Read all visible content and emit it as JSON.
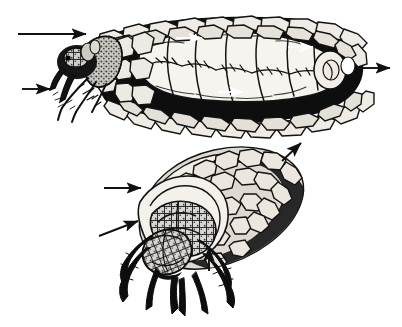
{
  "figure": {
    "title": "Caddisfly larva in portable stone case",
    "background_color": "#ffffff",
    "ink_color": "#111111",
    "width": 402,
    "height": 327,
    "caption": "",
    "panels": [
      {
        "id": "panel-top",
        "name": "lateral-cutaway-view",
        "description": "Lateral cutaway of a caddisfly larva inside its pebble case, anterior to the left, showing segmented abdomen with lateral gill tufts and the water current passing through the case",
        "orientation": "lateral",
        "bounds": {
          "x": 60,
          "y": 8,
          "width": 320,
          "height": 120
        }
      },
      {
        "id": "panel-bottom",
        "name": "oblique-anterior-view",
        "description": "Oblique anterior view of the larva extending head, thoracic plates and three pairs of legs from the mouth of the pebble case",
        "orientation": "oblique-anterior",
        "bounds": {
          "x": 110,
          "y": 140,
          "width": 200,
          "height": 180
        }
      }
    ],
    "arrows": [
      {
        "name": "arrow-case-anterior-opening",
        "panel": "panel-top",
        "label": "anterior case opening",
        "x1": 18,
        "y1": 34,
        "x2": 86,
        "y2": 34,
        "direction": "right",
        "style": "solid-external",
        "color": "#111111"
      },
      {
        "name": "arrow-larval-legs",
        "panel": "panel-top",
        "label": "thoracic legs",
        "x1": 22,
        "y1": 89,
        "x2": 50,
        "y2": 89,
        "direction": "right",
        "style": "solid-external",
        "color": "#111111"
      },
      {
        "name": "arrow-case-posterior-outflow",
        "panel": "panel-top",
        "label": "posterior outflow",
        "x1": 360,
        "y1": 68,
        "x2": 390,
        "y2": 68,
        "direction": "right",
        "style": "solid-external",
        "color": "#111111"
      },
      {
        "name": "arrow-water-current-upper",
        "panel": "panel-top",
        "label": "water current",
        "x1": 176,
        "y1": 38,
        "x2": 202,
        "y2": 38,
        "direction": "right",
        "style": "white-internal",
        "color": "#ffffff"
      },
      {
        "name": "arrow-water-current-mid",
        "panel": "panel-top",
        "label": "water current",
        "x1": 288,
        "y1": 47,
        "x2": 313,
        "y2": 47,
        "direction": "right",
        "style": "white-internal",
        "color": "#ffffff"
      },
      {
        "name": "arrow-water-current-lower",
        "panel": "panel-top",
        "label": "water current",
        "x1": 218,
        "y1": 92,
        "x2": 243,
        "y2": 92,
        "direction": "right",
        "style": "white-internal",
        "color": "#ffffff"
      },
      {
        "name": "arrow-case-mouth",
        "panel": "panel-bottom",
        "label": "case mouth",
        "x1": 104,
        "y1": 188,
        "x2": 141,
        "y2": 188,
        "direction": "right",
        "style": "solid-external",
        "color": "#111111"
      },
      {
        "name": "arrow-pronotum",
        "panel": "panel-bottom",
        "label": "pronotum",
        "x1": 99,
        "y1": 236,
        "x2": 138,
        "y2": 221,
        "direction": "up-right",
        "style": "solid-external",
        "color": "#111111"
      },
      {
        "name": "arrow-case-posterior-bottom",
        "panel": "panel-bottom",
        "label": "posterior of case",
        "x1": 282,
        "y1": 161,
        "x2": 301,
        "y2": 143,
        "direction": "up-right",
        "style": "solid-external",
        "color": "#111111"
      },
      {
        "name": "arrow-leg-detail",
        "panel": "panel-bottom",
        "label": "leg",
        "x1": 209,
        "y1": 271,
        "x2": 209,
        "y2": 247,
        "direction": "up",
        "style": "solid-external",
        "color": "#111111"
      }
    ]
  }
}
